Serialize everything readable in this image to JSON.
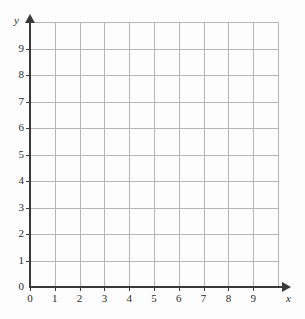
{
  "chart_data": {
    "type": "scatter",
    "title": "",
    "subtitle": "",
    "xlabel": "x",
    "ylabel": "y",
    "xlim": [
      0,
      10
    ],
    "ylim": [
      0,
      10
    ],
    "x_ticks": [
      0,
      1,
      2,
      3,
      4,
      5,
      6,
      7,
      8,
      9
    ],
    "y_ticks": [
      0,
      1,
      2,
      3,
      4,
      5,
      6,
      7,
      8,
      9
    ],
    "x_tick_labels": [
      "0",
      "1",
      "2",
      "3",
      "4",
      "5",
      "6",
      "7",
      "8",
      "9"
    ],
    "y_tick_labels": [
      "0",
      "1",
      "2",
      "3",
      "4",
      "5",
      "6",
      "7",
      "8",
      "9"
    ],
    "grid": true,
    "grid_columns": 10,
    "grid_rows": 10,
    "series": [],
    "annotations": [],
    "legend": null
  },
  "axes": {
    "y_name": "y",
    "x_name": "x",
    "origin_label": "0"
  },
  "colors": {
    "background": "#fdfdfd",
    "grid_line": "#b5b5b5",
    "axis_line": "#3a3a3a",
    "label_text": "#2b2b2b"
  }
}
